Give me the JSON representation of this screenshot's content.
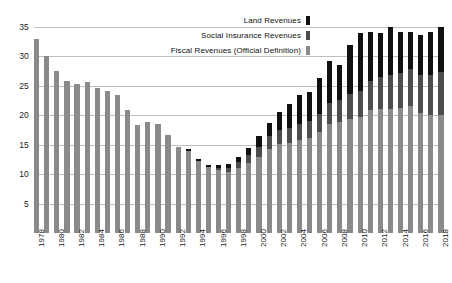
{
  "chart_data": {
    "type": "bar",
    "stacked": true,
    "title": "",
    "xlabel": "",
    "ylabel": "",
    "ylim": [
      0,
      35
    ],
    "yticks": [
      5,
      10,
      15,
      20,
      25,
      30,
      35
    ],
    "grid": true,
    "legend_position": "top-right",
    "colors": {
      "land": "#111111",
      "social": "#4d4d4d",
      "fiscal": "#8a8a8a",
      "gridline": "#bfbfbf",
      "background": "#ffffff"
    },
    "categories": [
      "1978",
      "1979",
      "1980",
      "1981",
      "1982",
      "1983",
      "1984",
      "1985",
      "1986",
      "1987",
      "1988",
      "1989",
      "1990",
      "1991",
      "1992",
      "1993",
      "1994",
      "1995",
      "1996",
      "1997",
      "1998",
      "1999",
      "2000",
      "2001",
      "2002",
      "2003",
      "2004",
      "2005",
      "2006",
      "2007",
      "2008",
      "2009",
      "2010",
      "2011",
      "2012",
      "2013",
      "2014",
      "2015",
      "2016",
      "2017",
      "2018"
    ],
    "tick_labels": [
      "1978",
      "",
      "1980",
      "",
      "1982",
      "",
      "1984",
      "",
      "1986",
      "",
      "1988",
      "",
      "1990",
      "",
      "1992",
      "",
      "1994",
      "",
      "1996",
      "",
      "1998",
      "",
      "2000",
      "",
      "2002",
      "",
      "2004",
      "",
      "2006",
      "",
      "2008",
      "",
      "2010",
      "",
      "2012",
      "",
      "2014",
      "",
      "2016",
      "",
      "2018"
    ],
    "series": [
      {
        "name": "Fiscal Revenues (Official Definition)",
        "key": "fiscal",
        "color": "#8a8a8a",
        "values": [
          33.0,
          30.1,
          27.5,
          25.8,
          25.3,
          25.7,
          24.6,
          24.1,
          23.4,
          20.9,
          18.4,
          18.9,
          18.5,
          16.6,
          14.6,
          14.0,
          12.2,
          11.2,
          10.7,
          10.4,
          11.0,
          11.9,
          12.9,
          14.3,
          15.1,
          15.3,
          15.8,
          16.2,
          17.1,
          18.6,
          18.8,
          19.3,
          19.7,
          20.9,
          21.1,
          21.2,
          21.3,
          21.6,
          20.4,
          20.1,
          20.4
        ]
      },
      {
        "name": "Social Insurance Revenues",
        "key": "social",
        "color": "#4d4d4d",
        "values": [
          0.0,
          0.0,
          0.0,
          0.0,
          0.0,
          0.0,
          0.0,
          0.0,
          0.0,
          0.0,
          0.0,
          0.0,
          0.0,
          0.0,
          0.0,
          0.0,
          0.0,
          0.0,
          0.4,
          0.7,
          1.0,
          1.4,
          1.7,
          2.1,
          2.4,
          2.5,
          2.7,
          2.9,
          3.2,
          3.5,
          3.8,
          4.3,
          4.5,
          5.0,
          5.4,
          5.7,
          5.9,
          6.2,
          6.4,
          6.7,
          7.4
        ]
      },
      {
        "name": "Land Revenues",
        "key": "land",
        "color": "#111111",
        "values": [
          0.0,
          0.0,
          0.0,
          0.0,
          0.0,
          0.0,
          0.0,
          0.0,
          0.0,
          0.0,
          0.0,
          0.0,
          0.0,
          0.0,
          0.0,
          0.3,
          0.3,
          0.4,
          0.5,
          0.7,
          0.9,
          1.2,
          1.8,
          2.3,
          3.1,
          4.2,
          5.0,
          4.9,
          6.0,
          7.2,
          6.0,
          8.4,
          9.8,
          8.2,
          7.5,
          8.2,
          7.0,
          6.4,
          6.9,
          7.4,
          7.7
        ]
      }
    ],
    "totals": [
      33.0,
      30.1,
      27.5,
      25.8,
      25.3,
      25.7,
      24.6,
      24.1,
      23.4,
      20.9,
      18.4,
      18.9,
      18.5,
      16.6,
      14.6,
      14.3,
      12.5,
      11.6,
      11.6,
      11.8,
      12.9,
      14.5,
      16.4,
      18.7,
      20.6,
      22.0,
      23.5,
      24.0,
      26.3,
      29.3,
      28.6,
      32.0,
      34.0,
      34.1,
      34.0,
      35.1,
      34.2,
      34.2,
      33.7,
      34.2,
      35.5
    ]
  },
  "legend": {
    "items": [
      {
        "label": "Land Revenues",
        "swatch_class": "sw-land"
      },
      {
        "label": "Social  Insurance Revenues",
        "swatch_class": "sw-social"
      },
      {
        "label": "Fiscal Revenues (Official Definition)",
        "swatch_class": "sw-fiscal"
      }
    ]
  }
}
